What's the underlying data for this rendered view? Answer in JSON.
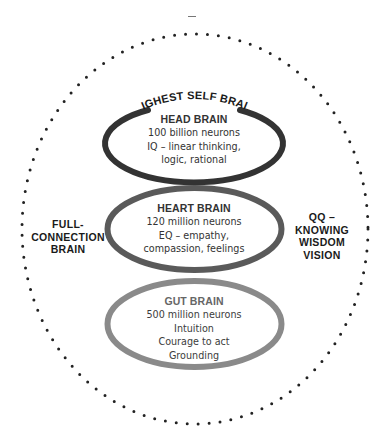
{
  "diagram": {
    "top_mark": "–",
    "outer_boundary": {
      "style": "dotted",
      "color": "#222222"
    },
    "arc_label": "HIGHEST SELF BRAIN",
    "left_label": [
      "FULL-",
      "CONNECTION",
      "BRAIN"
    ],
    "right_label": [
      "QQ –",
      "KNOWING",
      "WISDOM",
      "VISION"
    ],
    "rings": [
      {
        "id": "head",
        "title": "HEAD BRAIN",
        "lines": [
          "100 billion neurons",
          "IQ – linear thinking,",
          "logic, rational"
        ],
        "color": "#333333"
      },
      {
        "id": "heart",
        "title": "HEART BRAIN",
        "lines": [
          "120 million neurons",
          "EQ – empathy,",
          "compassion, feelings"
        ],
        "color": "#5a5a5a"
      },
      {
        "id": "gut",
        "title": "GUT BRAIN",
        "lines": [
          "500 million neurons",
          "Intuition",
          "Courage to act",
          "Grounding"
        ],
        "color": "#8a8a8a"
      }
    ]
  }
}
